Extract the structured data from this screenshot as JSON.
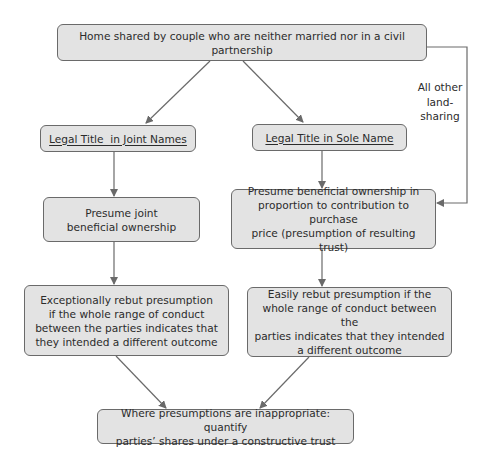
{
  "diagram": {
    "nodes": {
      "root": "Home shared by couple who are neither married nor in a civil partnership",
      "joint_title": "Legal Title  in Joint Names",
      "sole_title": "Legal Title in Sole Name",
      "joint_presume": [
        "Presume joint",
        "beneficial ownership"
      ],
      "sole_presume": [
        "Presume beneficial ownership in",
        "proportion to contribution to purchase",
        "price (presumption of resulting trust)"
      ],
      "joint_rebut": [
        "Exceptionally rebut presumption",
        "if the whole range of conduct",
        "between the parties indicates that",
        "they intended a different outcome"
      ],
      "sole_rebut": [
        "Easily rebut presumption if the",
        "whole range of conduct between the",
        "parties indicates that they intended",
        "a different outcome"
      ],
      "outcome": [
        "Where presumptions are inappropriate: quantify",
        "parties’ shares under a constructive trust"
      ]
    },
    "side_label": [
      "All other",
      "land-",
      "sharing"
    ],
    "edges": [
      {
        "from": "root",
        "to": "joint_title"
      },
      {
        "from": "root",
        "to": "sole_title"
      },
      {
        "from": "root",
        "to": "sole_presume",
        "label": "All other land-sharing"
      },
      {
        "from": "joint_title",
        "to": "joint_presume"
      },
      {
        "from": "sole_title",
        "to": "sole_presume"
      },
      {
        "from": "joint_presume",
        "to": "joint_rebut"
      },
      {
        "from": "sole_presume",
        "to": "sole_rebut"
      },
      {
        "from": "joint_rebut",
        "to": "outcome"
      },
      {
        "from": "sole_rebut",
        "to": "outcome"
      }
    ],
    "colors": {
      "box_fill": "#e3e3e3",
      "box_border": "#6a6a6a",
      "line": "#6a6a6a",
      "text": "#2b2b2b"
    }
  }
}
